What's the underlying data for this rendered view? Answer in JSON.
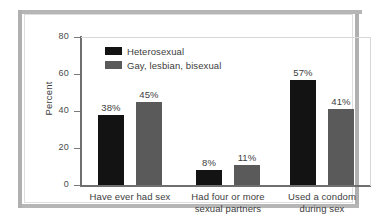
{
  "figure": {
    "frame_color": "#b3b3b3",
    "plate_background": "#ffffff"
  },
  "chart_data": {
    "type": "bar",
    "title": "",
    "subtitle": "",
    "xlabel": "",
    "ylabel": "Percent",
    "ylim": [
      0,
      80
    ],
    "yticks": [
      0,
      20,
      40,
      60,
      80
    ],
    "ytick_labels": [
      "0",
      "20",
      "40",
      "60",
      "80"
    ],
    "grid": false,
    "legend_position": "top-left-inside",
    "categories": [
      "Have ever had sex",
      "Had four or more sexual partners",
      "Used a condom during sex"
    ],
    "category_lines": [
      [
        "Have ever had sex"
      ],
      [
        "Had four or more",
        "sexual partners"
      ],
      [
        "Used a condom",
        "during sex"
      ]
    ],
    "series": [
      {
        "name": "Heterosexual",
        "color": "#131313",
        "values": [
          38,
          8,
          57
        ],
        "value_labels": [
          "38%",
          "45%",
          "8%"
        ]
      },
      {
        "name": "Gay, lesbian, bisexual",
        "color": "#5a5a5a",
        "values": [
          45,
          11,
          41
        ],
        "value_labels": [
          "45%",
          "11%",
          "41%"
        ]
      }
    ],
    "data_labels": [
      [
        "38%",
        "8%",
        "57%"
      ],
      [
        "45%",
        "11%",
        "41%"
      ]
    ],
    "units": "percent",
    "axis_color": "#6f6f6f"
  }
}
